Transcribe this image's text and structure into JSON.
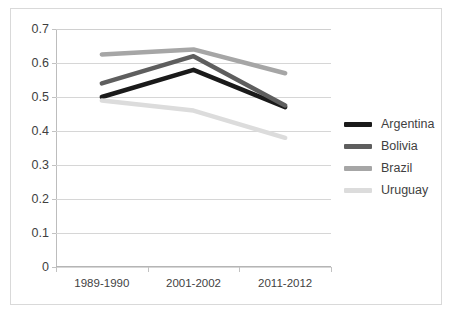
{
  "chart_data": {
    "type": "line",
    "title": "",
    "xlabel": "",
    "ylabel": "",
    "categories": [
      "1989-1990",
      "2001-2002",
      "2011-2012"
    ],
    "ylim": [
      0,
      0.7
    ],
    "yticks": [
      "0",
      "0.1",
      "0.2",
      "0.3",
      "0.4",
      "0.5",
      "0.6",
      "0.7"
    ],
    "ytick_values": [
      0,
      0.1,
      0.2,
      0.3,
      0.4,
      0.5,
      0.6,
      0.7
    ],
    "grid": true,
    "legend_position": "right",
    "series": [
      {
        "name": "Argentina",
        "values": [
          0.5,
          0.58,
          0.47
        ],
        "color": "#1a1a1a"
      },
      {
        "name": "Bolivia",
        "values": [
          0.54,
          0.62,
          0.475
        ],
        "color": "#5e5e5e"
      },
      {
        "name": "Brazil",
        "values": [
          0.625,
          0.64,
          0.57
        ],
        "color": "#a6a6a6"
      },
      {
        "name": "Uruguay",
        "values": [
          0.49,
          0.46,
          0.38
        ],
        "color": "#dcdcdc"
      }
    ]
  }
}
